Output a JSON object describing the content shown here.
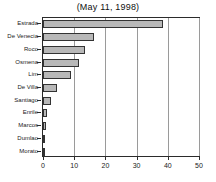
{
  "chart_data": {
    "type": "bar",
    "orientation": "horizontal",
    "title": "(May 11, 1998)",
    "xlabel": "",
    "ylabel": "",
    "xlim": [
      0,
      50
    ],
    "grid": true,
    "legend": "none",
    "xticks": [
      0,
      10,
      20,
      30,
      40,
      50
    ],
    "xtick_labels": [
      "0",
      "10",
      "20",
      "30",
      "40",
      "50"
    ],
    "categories": [
      "Morato",
      "Dumlao",
      "Marcos",
      "Enrile",
      "Santiago",
      "De Villa",
      "Lim",
      "Osmena",
      "Roco",
      "De Venecia",
      "Estrada"
    ],
    "values": [
      0.05,
      0.2,
      0.9,
      1.2,
      2.7,
      4.5,
      9.0,
      11.5,
      13.5,
      16.5,
      38.5
    ],
    "bar_color": "#b8b8b8",
    "bar_edge_color": "#333333"
  }
}
